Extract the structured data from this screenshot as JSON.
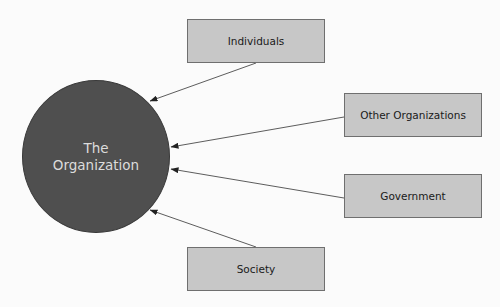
{
  "diagram": {
    "center": {
      "line1": "The",
      "line2": "Organization",
      "fill": "#4f4f4f",
      "text_color": "#dcdcdc"
    },
    "nodes": [
      {
        "id": "individuals",
        "label": "Individuals"
      },
      {
        "id": "other-organizations",
        "label": "Other Organizations"
      },
      {
        "id": "government",
        "label": "Government"
      },
      {
        "id": "society",
        "label": "Society"
      }
    ],
    "node_fill": "#c7c7c7",
    "edges": [
      {
        "from": "individuals",
        "to": "center"
      },
      {
        "from": "other-organizations",
        "to": "center"
      },
      {
        "from": "government",
        "to": "center"
      },
      {
        "from": "society",
        "to": "center"
      }
    ]
  }
}
